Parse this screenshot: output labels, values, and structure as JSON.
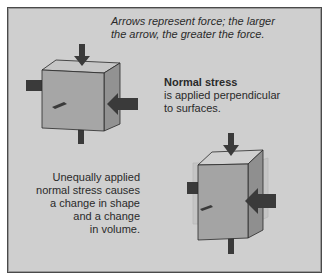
{
  "caption": {
    "line1": "Arrows represent force; the larger",
    "line2": "the arrow, the greater the force."
  },
  "normal_stress": {
    "title": "Normal stress",
    "line1": "is applied perpendicular",
    "line2": "to surfaces."
  },
  "unequal_stress": {
    "lines": [
      "Unequally applied",
      "normal stress causes",
      "a change in shape",
      "and a change",
      "in volume."
    ]
  },
  "colors": {
    "background": "#cfcfcf",
    "frame_border": "#4a4a4a",
    "cube_front": "#a8a8a8",
    "cube_top": "#c4c4c4",
    "cube_side": "#949494",
    "arrow": "#3a3a3a"
  },
  "figures": [
    {
      "name": "uniform-cube",
      "description": "Cube with equal arrows on all faces"
    },
    {
      "name": "deformed-block",
      "description": "Block compressed horizontally and elongated vertically"
    }
  ]
}
